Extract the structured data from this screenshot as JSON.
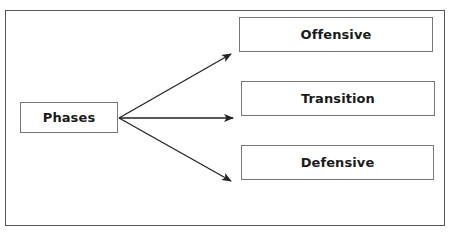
{
  "diagram": {
    "type": "flow",
    "root": {
      "id": "phases",
      "label": "Phases"
    },
    "nodes": [
      {
        "id": "offensive",
        "label": "Offensive"
      },
      {
        "id": "transition",
        "label": "Transition"
      },
      {
        "id": "defensive",
        "label": "Defensive"
      }
    ],
    "edges": [
      {
        "from": "phases",
        "to": "offensive"
      },
      {
        "from": "phases",
        "to": "transition"
      },
      {
        "from": "phases",
        "to": "defensive"
      }
    ],
    "colors": {
      "frame": "#555555",
      "box_border": "#777777",
      "arrow": "#222222",
      "text": "#1a1a1a"
    }
  }
}
